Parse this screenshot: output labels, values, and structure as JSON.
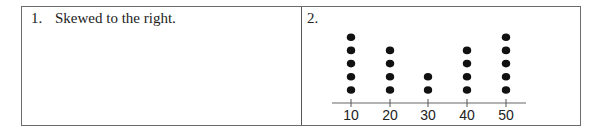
{
  "cells": [
    {
      "number": "1.",
      "text": "Skewed to the right."
    },
    {
      "number": "2."
    }
  ],
  "chart_data": {
    "type": "dot",
    "categories": [
      "10",
      "20",
      "30",
      "40",
      "50"
    ],
    "values": [
      5,
      4,
      2,
      4,
      5
    ],
    "title": "",
    "xlabel": "",
    "ylabel": "",
    "grid": false,
    "dot_color": "#111111",
    "axis_color": "#999999"
  }
}
